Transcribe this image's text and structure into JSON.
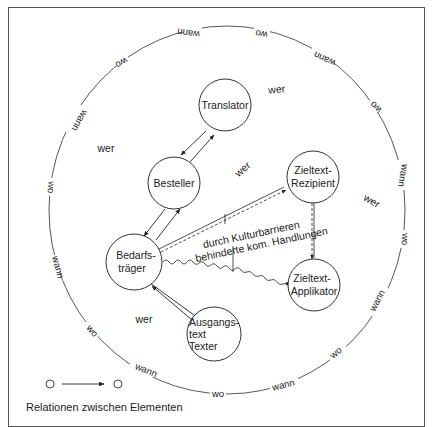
{
  "diagram": {
    "nodes": [
      {
        "id": "translator",
        "lines": [
          "Translator"
        ]
      },
      {
        "id": "besteller",
        "lines": [
          "Besteller"
        ]
      },
      {
        "id": "bedarfstraeger",
        "lines": [
          "Bedarfs-",
          "träger"
        ]
      },
      {
        "id": "zieltext-rezipient",
        "lines": [
          "Zieltext-",
          "Rezipient"
        ]
      },
      {
        "id": "zieltext-applikator",
        "lines": [
          "Zieltext-",
          "Applikator"
        ]
      },
      {
        "id": "ausgangstext-texter",
        "lines": [
          "Ausgangs-",
          "text",
          "Texter"
        ]
      }
    ],
    "wer_labels": [
      "wer",
      "wer",
      "wer",
      "wer",
      "wer"
    ],
    "ring_labels": {
      "wann": "wann",
      "wo": "wo"
    },
    "annotation": {
      "line1": "durch Kulturbarrieren",
      "line2": "behinderte kom. Handlungen"
    },
    "legend": {
      "text": "Relationen zwischen Elementen"
    }
  }
}
